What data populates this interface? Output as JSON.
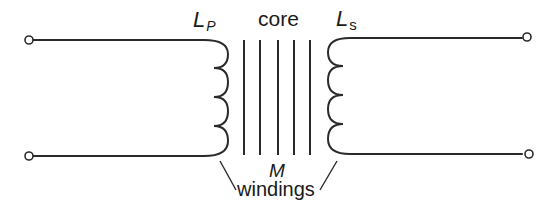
{
  "diagram": {
    "labels": {
      "primary_inductance": {
        "main": "L",
        "sub": "P"
      },
      "secondary_inductance": {
        "main": "L",
        "sub": "s"
      },
      "core": "core",
      "mutual_inductance": "M",
      "windings": "windings"
    },
    "core": {
      "line_count": 5
    },
    "primary_coil": {
      "turns": 4
    },
    "secondary_coil": {
      "turns": 4
    },
    "terminals": [
      {
        "id": "primary-top"
      },
      {
        "id": "primary-bottom"
      },
      {
        "id": "secondary-top"
      },
      {
        "id": "secondary-bottom"
      }
    ],
    "colors": {
      "ink": "#2a2a2a",
      "background": "#ffffff"
    }
  }
}
